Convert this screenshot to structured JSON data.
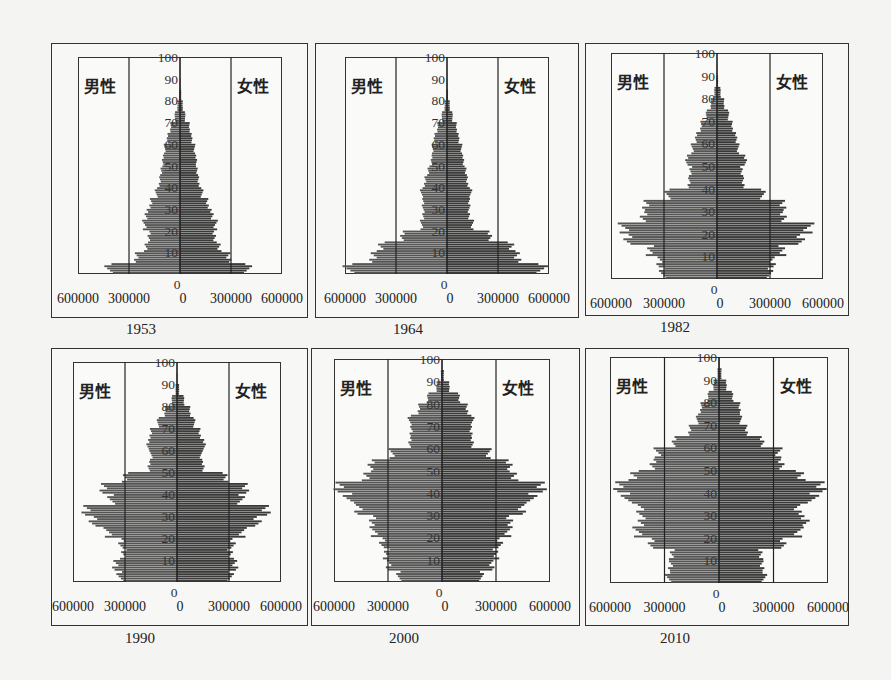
{
  "figure": {
    "male_label": "男性",
    "female_label": "女性",
    "y_ticks": [
      "0",
      "10",
      "20",
      "30",
      "40",
      "50",
      "60",
      "70",
      "80",
      "90",
      "100"
    ],
    "x_tick_labels": [
      "600000",
      "300000",
      "0",
      "0",
      "300000",
      "600000"
    ],
    "bar_color": "#3a3a3a"
  },
  "chart_data": [
    {
      "type": "bar",
      "orientation": "horizontal-pyramid",
      "title": "1953",
      "xlabel": "",
      "ylabel": "年龄",
      "x_ticks": [
        600000,
        300000,
        0,
        300000,
        600000
      ],
      "xlim": [
        -600000,
        600000
      ],
      "ylim": [
        0,
        100
      ],
      "age_groups": [
        0,
        5,
        10,
        15,
        20,
        25,
        30,
        35,
        40,
        45,
        50,
        55,
        60,
        65,
        70,
        75,
        80,
        85,
        90,
        95
      ],
      "series": [
        {
          "name": "男性",
          "values": [
            420000,
            260000,
            200000,
            180000,
            210000,
            200000,
            170000,
            140000,
            120000,
            110000,
            100000,
            90000,
            75000,
            55000,
            30000,
            15000,
            6000,
            2000,
            500,
            0
          ]
        },
        {
          "name": "女性",
          "values": [
            400000,
            290000,
            230000,
            200000,
            210000,
            190000,
            160000,
            130000,
            110000,
            100000,
            95000,
            85000,
            70000,
            55000,
            30000,
            16000,
            7000,
            2500,
            600,
            0
          ]
        }
      ]
    },
    {
      "type": "bar",
      "orientation": "horizontal-pyramid",
      "title": "1964",
      "xlabel": "",
      "ylabel": "年龄",
      "x_ticks": [
        600000,
        300000,
        0,
        300000,
        600000
      ],
      "xlim": [
        -600000,
        600000
      ],
      "ylim": [
        0,
        100
      ],
      "age_groups": [
        0,
        5,
        10,
        15,
        20,
        25,
        30,
        35,
        40,
        45,
        50,
        55,
        60,
        65,
        70,
        75,
        80,
        85,
        90,
        95
      ],
      "series": [
        {
          "name": "男性",
          "values": [
            580000,
            440000,
            390000,
            260000,
            150000,
            140000,
            140000,
            150000,
            130000,
            110000,
            90000,
            85000,
            75000,
            55000,
            30000,
            14000,
            5000,
            1500,
            400,
            0
          ]
        },
        {
          "name": "女性",
          "values": [
            560000,
            420000,
            380000,
            250000,
            150000,
            130000,
            130000,
            140000,
            120000,
            110000,
            95000,
            85000,
            70000,
            55000,
            32000,
            16000,
            6000,
            2000,
            500,
            0
          ]
        }
      ]
    },
    {
      "type": "bar",
      "orientation": "horizontal-pyramid",
      "title": "1982",
      "xlabel": "",
      "ylabel": "年龄",
      "x_ticks": [
        600000,
        300000,
        0,
        300000,
        600000
      ],
      "xlim": [
        -600000,
        600000
      ],
      "ylim": [
        0,
        100
      ],
      "age_groups": [
        0,
        5,
        10,
        15,
        20,
        25,
        30,
        35,
        40,
        45,
        50,
        55,
        60,
        65,
        70,
        75,
        80,
        85,
        90,
        95
      ],
      "series": [
        {
          "name": "男性",
          "values": [
            310000,
            330000,
            380000,
            500000,
            530000,
            420000,
            400000,
            280000,
            160000,
            150000,
            170000,
            140000,
            120000,
            90000,
            60000,
            35000,
            15000,
            4000,
            800,
            0
          ]
        },
        {
          "name": "女性",
          "values": [
            300000,
            320000,
            370000,
            470000,
            520000,
            380000,
            370000,
            260000,
            150000,
            140000,
            160000,
            120000,
            110000,
            85000,
            65000,
            40000,
            20000,
            6000,
            1200,
            0
          ]
        }
      ]
    },
    {
      "type": "bar",
      "orientation": "horizontal-pyramid",
      "title": "1990",
      "xlabel": "",
      "ylabel": "年龄",
      "x_ticks": [
        600000,
        300000,
        0,
        300000,
        600000
      ],
      "xlim": [
        -600000,
        600000
      ],
      "ylim": [
        0,
        100
      ],
      "age_groups": [
        0,
        5,
        10,
        15,
        20,
        25,
        30,
        35,
        40,
        45,
        50,
        55,
        60,
        65,
        70,
        75,
        80,
        85,
        90,
        95
      ],
      "series": [
        {
          "name": "男性",
          "values": [
            330000,
            360000,
            310000,
            320000,
            400000,
            490000,
            520000,
            380000,
            430000,
            300000,
            160000,
            150000,
            170000,
            150000,
            110000,
            70000,
            30000,
            8000,
            1500,
            0
          ]
        },
        {
          "name": "女性",
          "values": [
            310000,
            340000,
            310000,
            320000,
            380000,
            470000,
            510000,
            370000,
            400000,
            280000,
            150000,
            140000,
            160000,
            130000,
            100000,
            75000,
            40000,
            12000,
            2500,
            0
          ]
        }
      ]
    },
    {
      "type": "bar",
      "orientation": "horizontal-pyramid",
      "title": "2000",
      "xlabel": "",
      "ylabel": "年龄",
      "x_ticks": [
        600000,
        300000,
        0,
        300000,
        600000
      ],
      "xlim": [
        -600000,
        600000
      ],
      "ylim": [
        0,
        100
      ],
      "age_groups": [
        0,
        5,
        10,
        15,
        20,
        25,
        30,
        35,
        40,
        45,
        50,
        55,
        60,
        65,
        70,
        75,
        80,
        85,
        90,
        95
      ],
      "series": [
        {
          "name": "男性",
          "values": [
            240000,
            300000,
            310000,
            330000,
            380000,
            390000,
            460000,
            520000,
            580000,
            420000,
            390000,
            280000,
            180000,
            170000,
            180000,
            130000,
            80000,
            30000,
            6000,
            800
          ]
        },
        {
          "name": "女性",
          "values": [
            220000,
            280000,
            300000,
            320000,
            370000,
            380000,
            440000,
            500000,
            560000,
            400000,
            370000,
            260000,
            170000,
            160000,
            170000,
            140000,
            95000,
            40000,
            10000,
            1500
          ]
        }
      ]
    },
    {
      "type": "bar",
      "orientation": "horizontal-pyramid",
      "title": "2010",
      "xlabel": "",
      "ylabel": "年龄",
      "x_ticks": [
        600000,
        300000,
        0,
        300000,
        600000
      ],
      "xlim": [
        -600000,
        600000
      ],
      "ylim": [
        0,
        100
      ],
      "age_groups": [
        0,
        5,
        10,
        15,
        20,
        25,
        30,
        35,
        40,
        45,
        50,
        55,
        60,
        65,
        70,
        75,
        80,
        85,
        90,
        95
      ],
      "series": [
        {
          "name": "男性",
          "values": [
            280000,
            270000,
            260000,
            370000,
            450000,
            430000,
            430000,
            510000,
            560000,
            470000,
            360000,
            340000,
            250000,
            160000,
            120000,
            100000,
            60000,
            30000,
            8000,
            1500
          ]
        },
        {
          "name": "女性",
          "values": [
            250000,
            240000,
            230000,
            350000,
            440000,
            480000,
            430000,
            520000,
            570000,
            450000,
            340000,
            330000,
            240000,
            150000,
            120000,
            115000,
            75000,
            40000,
            13000,
            3000
          ]
        }
      ]
    }
  ]
}
